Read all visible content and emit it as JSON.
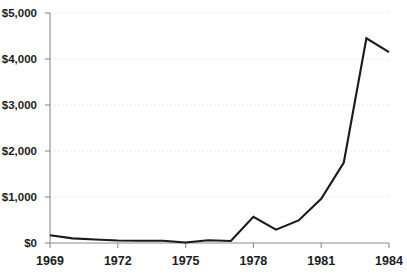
{
  "chart_data": {
    "type": "line",
    "title": "",
    "subtitle": "",
    "xlabel": "",
    "ylabel": "",
    "xlim": [
      1969,
      1984
    ],
    "ylim": [
      0,
      5000
    ],
    "grid": true,
    "legend": false,
    "legend_position": "none",
    "series_color": "#1a1a1a",
    "gridline_color": "#e9e9ee",
    "axis_color": "#8c8c8c",
    "text_color": "#1c1c1c",
    "y_ticks": [
      0,
      1000,
      2000,
      3000,
      4000,
      5000
    ],
    "y_tick_labels": [
      "$0",
      "$1,000",
      "$2,000",
      "$3,000",
      "$4,000",
      "$5,000"
    ],
    "x_ticks": [
      1969,
      1972,
      1975,
      1978,
      1981,
      1984
    ],
    "x_tick_labels": [
      "1969",
      "1972",
      "1975",
      "1978",
      "1981",
      "1984"
    ],
    "x": [
      1969,
      1970,
      1971,
      1972,
      1973,
      1974,
      1975,
      1976,
      1977,
      1978,
      1979,
      1980,
      1981,
      1982,
      1983,
      1984
    ],
    "values": [
      170,
      100,
      75,
      55,
      50,
      50,
      10,
      60,
      45,
      570,
      290,
      490,
      960,
      1750,
      4450,
      4150
    ],
    "series": [
      {
        "name": "",
        "values": [
          170,
          100,
          75,
          55,
          50,
          50,
          10,
          60,
          45,
          570,
          290,
          490,
          960,
          1750,
          4450,
          4150
        ]
      }
    ]
  },
  "layout": {
    "plot_left": 50,
    "plot_right": 389,
    "plot_top": 13,
    "plot_bottom": 243,
    "tick_length": 5,
    "ylabel_gap": 8,
    "xlabel_offset": 22
  }
}
